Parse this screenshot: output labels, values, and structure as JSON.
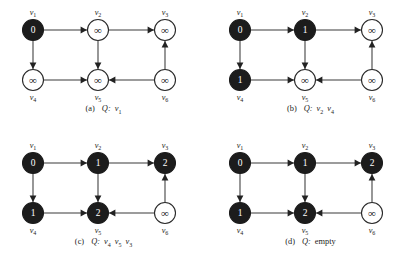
{
  "figure": {
    "background_color": "#ffffff",
    "node_filled_color": "#1c1c1c",
    "node_open_color": "#ffffff",
    "edge_color": "#3a3a3a",
    "infinity_symbol": "∞",
    "graph_layout": {
      "top_row_labels": [
        "v1",
        "v2",
        "v3"
      ],
      "bottom_row_labels": [
        "v4",
        "v5",
        "v6"
      ],
      "edges": [
        {
          "from": "v1",
          "to": "v2",
          "direction": "right"
        },
        {
          "from": "v2",
          "to": "v3",
          "direction": "right"
        },
        {
          "from": "v1",
          "to": "v4",
          "direction": "down"
        },
        {
          "from": "v2",
          "to": "v5",
          "direction": "down"
        },
        {
          "from": "v4",
          "to": "v5",
          "direction": "right"
        },
        {
          "from": "v6",
          "to": "v5",
          "direction": "left"
        },
        {
          "from": "v6",
          "to": "v3",
          "direction": "up"
        }
      ]
    }
  },
  "panels": [
    {
      "id": "a",
      "caption_tag": "(a)",
      "caption_queue_letter": "Q:",
      "caption_queue_items": [
        "v1"
      ],
      "caption_queue_empty_text": "",
      "nodes": [
        {
          "id": "v1",
          "label": "v",
          "sub": "1",
          "value": "0",
          "filled": true
        },
        {
          "id": "v2",
          "label": "v",
          "sub": "2",
          "value": "∞",
          "filled": false
        },
        {
          "id": "v3",
          "label": "v",
          "sub": "3",
          "value": "∞",
          "filled": false
        },
        {
          "id": "v4",
          "label": "v",
          "sub": "4",
          "value": "∞",
          "filled": false
        },
        {
          "id": "v5",
          "label": "v",
          "sub": "5",
          "value": "∞",
          "filled": false
        },
        {
          "id": "v6",
          "label": "v",
          "sub": "6",
          "value": "∞",
          "filled": false
        }
      ]
    },
    {
      "id": "b",
      "caption_tag": "(b)",
      "caption_queue_letter": "Q:",
      "caption_queue_items": [
        "v2",
        "v4"
      ],
      "caption_queue_empty_text": "",
      "nodes": [
        {
          "id": "v1",
          "label": "v",
          "sub": "1",
          "value": "0",
          "filled": true
        },
        {
          "id": "v2",
          "label": "v",
          "sub": "2",
          "value": "1",
          "filled": true
        },
        {
          "id": "v3",
          "label": "v",
          "sub": "3",
          "value": "∞",
          "filled": false
        },
        {
          "id": "v4",
          "label": "v",
          "sub": "4",
          "value": "1",
          "filled": true
        },
        {
          "id": "v5",
          "label": "v",
          "sub": "5",
          "value": "∞",
          "filled": false
        },
        {
          "id": "v6",
          "label": "v",
          "sub": "6",
          "value": "∞",
          "filled": false
        }
      ]
    },
    {
      "id": "c",
      "caption_tag": "(c)",
      "caption_queue_letter": "Q:",
      "caption_queue_items": [
        "v4",
        "v5",
        "v3"
      ],
      "caption_queue_empty_text": "",
      "nodes": [
        {
          "id": "v1",
          "label": "v",
          "sub": "1",
          "value": "0",
          "filled": true
        },
        {
          "id": "v2",
          "label": "v",
          "sub": "2",
          "value": "1",
          "filled": true
        },
        {
          "id": "v3",
          "label": "v",
          "sub": "3",
          "value": "2",
          "filled": true
        },
        {
          "id": "v4",
          "label": "v",
          "sub": "4",
          "value": "1",
          "filled": true
        },
        {
          "id": "v5",
          "label": "v",
          "sub": "5",
          "value": "2",
          "filled": true
        },
        {
          "id": "v6",
          "label": "v",
          "sub": "6",
          "value": "∞",
          "filled": false
        }
      ]
    },
    {
      "id": "d",
      "caption_tag": "(d)",
      "caption_queue_letter": "Q:",
      "caption_queue_items": [],
      "caption_queue_empty_text": "empty",
      "nodes": [
        {
          "id": "v1",
          "label": "v",
          "sub": "1",
          "value": "0",
          "filled": true
        },
        {
          "id": "v2",
          "label": "v",
          "sub": "2",
          "value": "1",
          "filled": true
        },
        {
          "id": "v3",
          "label": "v",
          "sub": "3",
          "value": "2",
          "filled": true
        },
        {
          "id": "v4",
          "label": "v",
          "sub": "4",
          "value": "1",
          "filled": true
        },
        {
          "id": "v5",
          "label": "v",
          "sub": "5",
          "value": "2",
          "filled": true
        },
        {
          "id": "v6",
          "label": "v",
          "sub": "6",
          "value": "∞",
          "filled": false
        }
      ]
    }
  ]
}
